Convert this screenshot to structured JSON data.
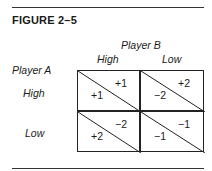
{
  "figure": {
    "title": "FIGURE 2–5",
    "player_b": "Player B",
    "player_a": "Player A",
    "columns": [
      "High",
      "Low"
    ],
    "rows": [
      "High",
      "Low"
    ],
    "payoffs": [
      [
        {
          "a": "+1",
          "b": "+1"
        },
        {
          "a": "−2",
          "b": "+2"
        }
      ],
      [
        {
          "a": "+2",
          "b": "−2"
        },
        {
          "a": "−1",
          "b": "−1"
        }
      ]
    ]
  }
}
